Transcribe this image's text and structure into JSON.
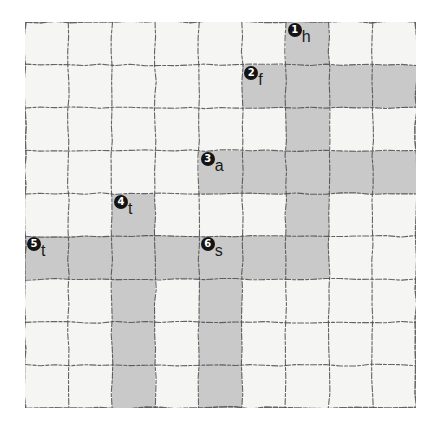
{
  "grid": {
    "rows": 9,
    "cols": 9,
    "cell_background": "#f5f5f3",
    "shaded_background": "#c9c9c9",
    "line_color": "#4a4a4a",
    "shaded_cells": [
      [
        0,
        6
      ],
      [
        1,
        5
      ],
      [
        1,
        6
      ],
      [
        1,
        7
      ],
      [
        1,
        8
      ],
      [
        2,
        6
      ],
      [
        3,
        4
      ],
      [
        3,
        5
      ],
      [
        3,
        6
      ],
      [
        3,
        7
      ],
      [
        3,
        8
      ],
      [
        4,
        2
      ],
      [
        4,
        6
      ],
      [
        5,
        0
      ],
      [
        5,
        1
      ],
      [
        5,
        2
      ],
      [
        5,
        3
      ],
      [
        5,
        4
      ],
      [
        5,
        5
      ],
      [
        5,
        6
      ],
      [
        6,
        2
      ],
      [
        6,
        4
      ],
      [
        7,
        2
      ],
      [
        7,
        4
      ],
      [
        8,
        2
      ],
      [
        8,
        4
      ]
    ]
  },
  "markers": [
    {
      "number": "1",
      "letter": "h",
      "row": 0,
      "col": 6
    },
    {
      "number": "2",
      "letter": "f",
      "row": 1,
      "col": 5
    },
    {
      "number": "3",
      "letter": "a",
      "row": 3,
      "col": 4
    },
    {
      "number": "4",
      "letter": "t",
      "row": 4,
      "col": 2
    },
    {
      "number": "5",
      "letter": "t",
      "row": 5,
      "col": 0
    },
    {
      "number": "6",
      "letter": "s",
      "row": 5,
      "col": 4
    }
  ]
}
